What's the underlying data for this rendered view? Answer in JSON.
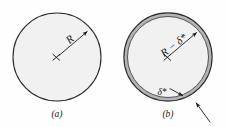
{
  "figure": {
    "background_color": "#fefefe",
    "panels": [
      {
        "id": "panel-a",
        "caption": "(a)",
        "description": "uniform disk of radius R",
        "disk": {
          "center_x": 57,
          "center_y": 57,
          "radius": 44,
          "fill_color": "#f1f1f1",
          "stroke_color": "#2b2b2b"
        },
        "center_marker": "×",
        "labels": [
          {
            "name": "radius-label",
            "text": "R",
            "x": 72,
            "y": 42
          }
        ]
      },
      {
        "id": "panel-b",
        "caption": "(b)",
        "description": "disk with displacement-thickness annulus at the wall",
        "disk": {
          "center_x": 168,
          "center_y": 57,
          "radius": 44,
          "fill_color": "#f1f1f1",
          "stroke_color": "#2b2b2b"
        },
        "annulus": {
          "band_color": "#b4b4b4",
          "band_width": 3.6,
          "line_color": "#3a3a3a"
        },
        "center_marker": "×",
        "labels": [
          {
            "name": "effective-radius-label",
            "text": "R − δ*",
            "x": 174,
            "y": 51
          },
          {
            "name": "displacement-thickness-label",
            "text": "δ*",
            "x": 161,
            "y": 94
          }
        ]
      }
    ]
  }
}
